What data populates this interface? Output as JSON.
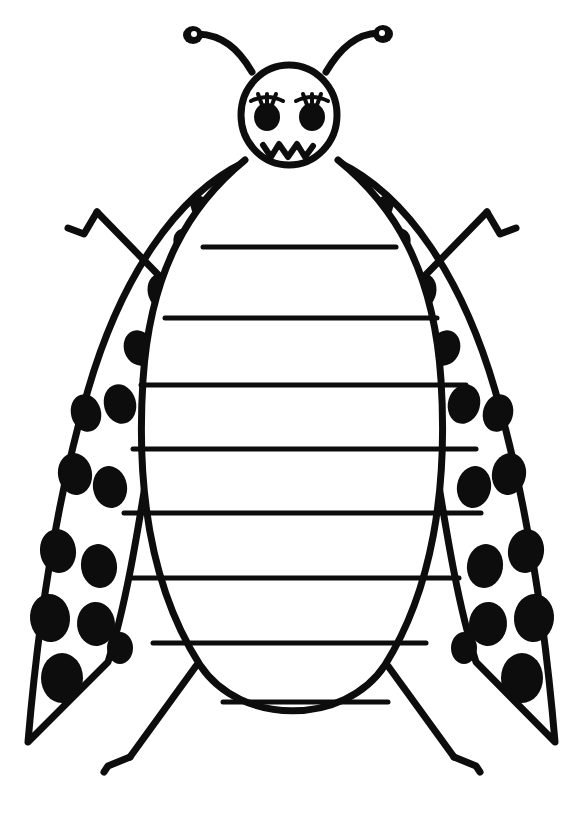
{
  "document": {
    "title": "Ladybug Writing Template",
    "medium": "hand-drawn black ink line art on white paper",
    "subject": "ladybug",
    "background_color": "#ffffff",
    "ink_color": "#0d0d0d",
    "canvas": {
      "width": 584,
      "height": 818
    }
  },
  "figure": {
    "name": "ladybug",
    "parts": [
      "head",
      "face",
      "antennae",
      "body",
      "left-wing",
      "right-wing",
      "legs",
      "writing-lines"
    ]
  },
  "head": {
    "label": "head",
    "shape": "circle",
    "cx": 289,
    "cy": 115,
    "rx": 48,
    "ry": 50,
    "stroke_width": 7
  },
  "face": {
    "label": "face",
    "expression": "angry",
    "eyes": [
      {
        "name": "left-eye",
        "cx": 267,
        "cy": 117,
        "rx": 13,
        "ry": 14,
        "lashes": 3
      },
      {
        "name": "right-eye",
        "cx": 312,
        "cy": 117,
        "rx": 13,
        "ry": 14,
        "lashes": 3
      }
    ],
    "mouth": {
      "name": "mouth",
      "shape": "zigzag",
      "points": "263,145 271,157 279,144 288,157 297,144 305,157 313,146",
      "stroke_width": 6
    }
  },
  "antennae": [
    {
      "name": "left-antenna",
      "path": "M 252,72 C 238,48 222,35 198,34",
      "knob": {
        "cx": 193,
        "cy": 35,
        "rx": 10,
        "ry": 9
      },
      "highlight": {
        "cx": 194,
        "cy": 34,
        "r": 3
      },
      "stroke_width": 7
    },
    {
      "name": "right-antenna",
      "path": "M 326,72 C 340,48 356,34 378,33",
      "knob": {
        "cx": 383,
        "cy": 34,
        "rx": 10,
        "ry": 9
      },
      "highlight": {
        "cx": 382,
        "cy": 33,
        "r": 3
      },
      "stroke_width": 7
    }
  ],
  "body": {
    "label": "body",
    "shape": "egg / oval",
    "description": "large egg shaped abdomen that holds the ruled writing lines",
    "path": "M 245,160 C 190,205 150,270 143,380 C 136,490 152,590 200,665 C 240,726 345,726 385,665 C 432,590 448,490 441,380 C 434,270 394,205 338,160",
    "stroke_width": 7,
    "fill": "#ffffff"
  },
  "wings": [
    {
      "name": "left-wing",
      "outer_path": "M 245,162 C 175,195 120,280 88,390 C 62,480 40,600 28,742 L 108,662 C 140,560 150,420 175,330 C 198,248 220,195 245,162 Z",
      "stroke_width": 7,
      "spots": [
        {
          "cx": 200,
          "cy": 207,
          "rx": 9,
          "ry": 12,
          "rot": -25
        },
        {
          "cx": 186,
          "cy": 243,
          "rx": 12,
          "ry": 15,
          "rot": -25
        },
        {
          "cx": 163,
          "cy": 292,
          "rx": 15,
          "ry": 19,
          "rot": -20
        },
        {
          "cx": 139,
          "cy": 348,
          "rx": 15,
          "ry": 18,
          "rot": -20
        },
        {
          "cx": 120,
          "cy": 404,
          "rx": 16,
          "ry": 20,
          "rot": -15
        },
        {
          "cx": 86,
          "cy": 413,
          "rx": 15,
          "ry": 19,
          "rot": -15
        },
        {
          "cx": 75,
          "cy": 474,
          "rx": 17,
          "ry": 21,
          "rot": -10
        },
        {
          "cx": 110,
          "cy": 487,
          "rx": 17,
          "ry": 21,
          "rot": -10
        },
        {
          "cx": 58,
          "cy": 551,
          "rx": 18,
          "ry": 22,
          "rot": -8
        },
        {
          "cx": 99,
          "cy": 566,
          "rx": 18,
          "ry": 22,
          "rot": -8
        },
        {
          "cx": 50,
          "cy": 618,
          "rx": 20,
          "ry": 24,
          "rot": -5
        },
        {
          "cx": 96,
          "cy": 624,
          "rx": 19,
          "ry": 22,
          "rot": -5
        },
        {
          "cx": 62,
          "cy": 678,
          "rx": 21,
          "ry": 25,
          "rot": 0
        },
        {
          "cx": 120,
          "cy": 648,
          "rx": 13,
          "ry": 16,
          "rot": 0
        }
      ]
    },
    {
      "name": "right-wing",
      "outer_path": "M 338,162 C 408,195 463,280 495,390 C 521,480 543,600 555,742 L 476,662 C 444,560 434,420 409,330 C 386,248 364,195 338,162 Z",
      "stroke_width": 7,
      "spots": [
        {
          "cx": 384,
          "cy": 207,
          "rx": 9,
          "ry": 12,
          "rot": 25
        },
        {
          "cx": 398,
          "cy": 243,
          "rx": 12,
          "ry": 15,
          "rot": 25
        },
        {
          "cx": 421,
          "cy": 292,
          "rx": 15,
          "ry": 19,
          "rot": 20
        },
        {
          "cx": 445,
          "cy": 348,
          "rx": 15,
          "ry": 18,
          "rot": 20
        },
        {
          "cx": 464,
          "cy": 404,
          "rx": 16,
          "ry": 20,
          "rot": 15
        },
        {
          "cx": 498,
          "cy": 413,
          "rx": 15,
          "ry": 19,
          "rot": 15
        },
        {
          "cx": 509,
          "cy": 474,
          "rx": 17,
          "ry": 21,
          "rot": 10
        },
        {
          "cx": 474,
          "cy": 487,
          "rx": 17,
          "ry": 21,
          "rot": 10
        },
        {
          "cx": 526,
          "cy": 551,
          "rx": 18,
          "ry": 22,
          "rot": 8
        },
        {
          "cx": 485,
          "cy": 566,
          "rx": 18,
          "ry": 22,
          "rot": 8
        },
        {
          "cx": 534,
          "cy": 618,
          "rx": 20,
          "ry": 24,
          "rot": 5
        },
        {
          "cx": 488,
          "cy": 624,
          "rx": 19,
          "ry": 22,
          "rot": 5
        },
        {
          "cx": 522,
          "cy": 678,
          "rx": 21,
          "ry": 25,
          "rot": 0
        },
        {
          "cx": 464,
          "cy": 648,
          "rx": 13,
          "ry": 16,
          "rot": 0
        }
      ]
    }
  ],
  "legs": [
    {
      "name": "upper-left-leg",
      "path": "M 175,292 L 97,212",
      "foot_path": "M 97,212 L 84,234 L 68,228",
      "stroke_width": 7
    },
    {
      "name": "upper-right-leg",
      "path": "M 409,292 L 487,212",
      "foot_path": "M 487,212 L 500,234 L 516,228",
      "stroke_width": 7
    },
    {
      "name": "lower-left-leg",
      "path": "M 196,666 L 130,757",
      "foot_path": "M 130,757 L 108,766 L 104,772",
      "stroke_width": 7
    },
    {
      "name": "lower-right-leg",
      "path": "M 388,666 L 454,757",
      "foot_path": "M 454,757 L 476,766 L 480,772",
      "stroke_width": 7
    }
  ],
  "writing_lines": {
    "label": "writing lines",
    "count": 8,
    "stroke_width": 5,
    "lines": [
      {
        "index": 1,
        "x1": 203,
        "x2": 396,
        "y": 247
      },
      {
        "index": 2,
        "x1": 165,
        "x2": 437,
        "y": 318
      },
      {
        "index": 3,
        "x1": 141,
        "x2": 466,
        "y": 385
      },
      {
        "index": 4,
        "x1": 133,
        "x2": 476,
        "y": 449
      },
      {
        "index": 5,
        "x1": 124,
        "x2": 481,
        "y": 513
      },
      {
        "index": 6,
        "x1": 131,
        "x2": 459,
        "y": 578
      },
      {
        "index": 7,
        "x1": 153,
        "x2": 426,
        "y": 643
      },
      {
        "index": 8,
        "x1": 223,
        "x2": 388,
        "y": 702
      }
    ]
  }
}
